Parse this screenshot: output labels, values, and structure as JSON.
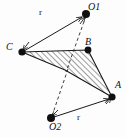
{
  "figure": {
    "background_color": "#fdfdfd",
    "stroke_color": "#1a1a1a",
    "hatch_color": "#2b2b2b",
    "point_color": "#101010",
    "labels": {
      "vertex_a": "A",
      "vertex_b": "B",
      "vertex_c": "C",
      "pivot_1": "O1",
      "pivot_2": "O2",
      "radius_top": "r",
      "radius_bottom": "r"
    },
    "points": [
      {
        "name": "O1",
        "label": "O1",
        "x": 86,
        "y": 14
      },
      {
        "name": "C",
        "label": "C",
        "x": 22,
        "y": 52
      },
      {
        "name": "B",
        "label": "B",
        "x": 88,
        "y": 50
      },
      {
        "name": "A",
        "label": "A",
        "x": 112,
        "y": 97
      },
      {
        "name": "O2",
        "label": "O2",
        "x": 51,
        "y": 118
      }
    ],
    "shape": {
      "name": "hatched-dart-region",
      "vertices": "22,52 88,50 112,97 65,70",
      "fill": "none",
      "hatch_angle_deg": 45
    },
    "arrows": [
      {
        "name": "arrow-C-to-O1",
        "from": "C",
        "to": "O1",
        "style": "solid",
        "label": "r"
      },
      {
        "name": "arrow-O2-to-A",
        "from": "O2",
        "to": "A",
        "style": "solid",
        "label": "r"
      }
    ],
    "dashed_lines": [
      {
        "name": "dashed-O1-to-center",
        "from": "O1",
        "to": "center"
      },
      {
        "name": "dashed-O2-to-center",
        "from": "O2",
        "to": "center"
      }
    ]
  }
}
